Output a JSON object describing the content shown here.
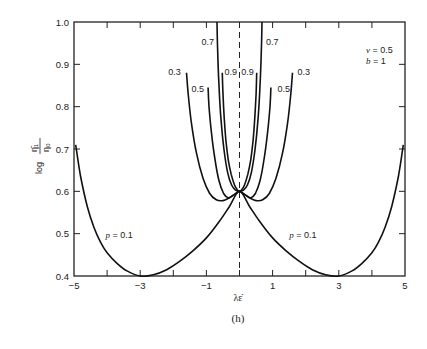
{
  "chart_data": {
    "type": "line",
    "title": "",
    "caption": "(h)",
    "xlabel": "λε̇",
    "ylabel": "log η̄₁/η₀",
    "xlim": [
      -5,
      5
    ],
    "ylim": [
      0.4,
      1.0
    ],
    "grid": false,
    "x_ticks": [
      -5,
      -4,
      -3,
      -2,
      -1,
      0,
      1,
      2,
      3,
      4,
      5
    ],
    "x_tick_labels": [
      "-5",
      "-3",
      "-1",
      "1",
      "3",
      "5"
    ],
    "x_tick_label_values": [
      -5,
      -3,
      -1,
      1,
      3,
      5
    ],
    "y_ticks": [
      0.4,
      0.5,
      0.6,
      0.7,
      0.8,
      0.9,
      1.0
    ],
    "y_tick_labels": [
      "0.4",
      "0.5",
      "0.6",
      "0.7",
      "0.8",
      "0.9",
      "1.0"
    ],
    "annotations": {
      "nu": "ν = 0.5",
      "b": "b = 1",
      "vertical_dashed_line_at_x": 0
    },
    "series": [
      {
        "name": "p = 0.1",
        "label": "p = 0.1",
        "x": [
          -4.95,
          -4.8,
          -4.6,
          -4.4,
          -4.2,
          -4.0,
          -3.7,
          -3.4,
          -3.0,
          -2.6,
          -2.2,
          -1.8,
          -1.4,
          -1.0,
          -0.6,
          -0.3,
          0,
          0.3,
          0.6,
          1.0,
          1.4,
          1.8,
          2.2,
          2.6,
          3.0,
          3.4,
          3.7,
          4.0,
          4.2,
          4.4,
          4.6,
          4.8,
          4.95
        ],
        "y": [
          0.71,
          0.635,
          0.565,
          0.515,
          0.48,
          0.455,
          0.43,
          0.412,
          0.4,
          0.403,
          0.415,
          0.435,
          0.46,
          0.49,
          0.53,
          0.565,
          0.6,
          0.565,
          0.53,
          0.49,
          0.46,
          0.435,
          0.415,
          0.403,
          0.4,
          0.412,
          0.43,
          0.455,
          0.48,
          0.515,
          0.565,
          0.635,
          0.71
        ]
      },
      {
        "name": "p = 0.3",
        "label": "0.3",
        "x": [
          -1.6,
          -1.55,
          -1.45,
          -1.3,
          -1.1,
          -0.9,
          -0.7,
          -0.5,
          -0.3,
          -0.15,
          0,
          0.15,
          0.3,
          0.5,
          0.7,
          0.9,
          1.1,
          1.3,
          1.45,
          1.55,
          1.6
        ],
        "y": [
          0.88,
          0.83,
          0.76,
          0.69,
          0.63,
          0.595,
          0.58,
          0.578,
          0.585,
          0.593,
          0.6,
          0.593,
          0.585,
          0.578,
          0.58,
          0.595,
          0.63,
          0.69,
          0.76,
          0.83,
          0.88
        ]
      },
      {
        "name": "p = 0.5",
        "label": "0.5",
        "x": [
          -0.95,
          -0.92,
          -0.85,
          -0.75,
          -0.62,
          -0.48,
          -0.34,
          -0.2,
          -0.1,
          0,
          0.1,
          0.2,
          0.34,
          0.48,
          0.62,
          0.75,
          0.85,
          0.92,
          0.95
        ],
        "y": [
          0.845,
          0.8,
          0.74,
          0.68,
          0.625,
          0.595,
          0.585,
          0.59,
          0.595,
          0.6,
          0.595,
          0.59,
          0.585,
          0.595,
          0.625,
          0.68,
          0.74,
          0.8,
          0.845
        ]
      },
      {
        "name": "p = 0.7",
        "label": "0.7",
        "x": [
          -0.68,
          -0.66,
          -0.62,
          -0.56,
          -0.47,
          -0.36,
          -0.24,
          -0.12,
          0,
          0.12,
          0.24,
          0.36,
          0.47,
          0.56,
          0.62,
          0.66,
          0.68
        ],
        "y": [
          1.0,
          0.93,
          0.85,
          0.77,
          0.7,
          0.645,
          0.615,
          0.603,
          0.6,
          0.603,
          0.615,
          0.645,
          0.7,
          0.77,
          0.85,
          0.93,
          1.0
        ]
      },
      {
        "name": "p = 0.9",
        "label": "0.9",
        "x": [
          -0.52,
          -0.5,
          -0.46,
          -0.41,
          -0.34,
          -0.25,
          -0.15,
          -0.07,
          0,
          0.07,
          0.15,
          0.25,
          0.34,
          0.41,
          0.46,
          0.5,
          0.52
        ],
        "y": [
          0.88,
          0.83,
          0.77,
          0.72,
          0.675,
          0.64,
          0.615,
          0.604,
          0.6,
          0.604,
          0.615,
          0.64,
          0.675,
          0.72,
          0.77,
          0.83,
          0.88
        ]
      }
    ],
    "curve_labels": [
      {
        "text": "0.7",
        "x": -1.15,
        "y": 0.945
      },
      {
        "text": "0.7",
        "x": 0.8,
        "y": 0.945
      },
      {
        "text": "0.3",
        "x": -2.15,
        "y": 0.875
      },
      {
        "text": "0.9",
        "x": -0.45,
        "y": 0.875
      },
      {
        "text": "0.9",
        "x": 0.05,
        "y": 0.875
      },
      {
        "text": "0.3",
        "x": 1.75,
        "y": 0.875
      },
      {
        "text": "0.5",
        "x": -1.45,
        "y": 0.835
      },
      {
        "text": "0.5",
        "x": 1.15,
        "y": 0.835
      },
      {
        "text": "p = 0.1",
        "x": -4.05,
        "y": 0.49
      },
      {
        "text": "p = 0.1",
        "x": 1.5,
        "y": 0.49
      }
    ]
  }
}
